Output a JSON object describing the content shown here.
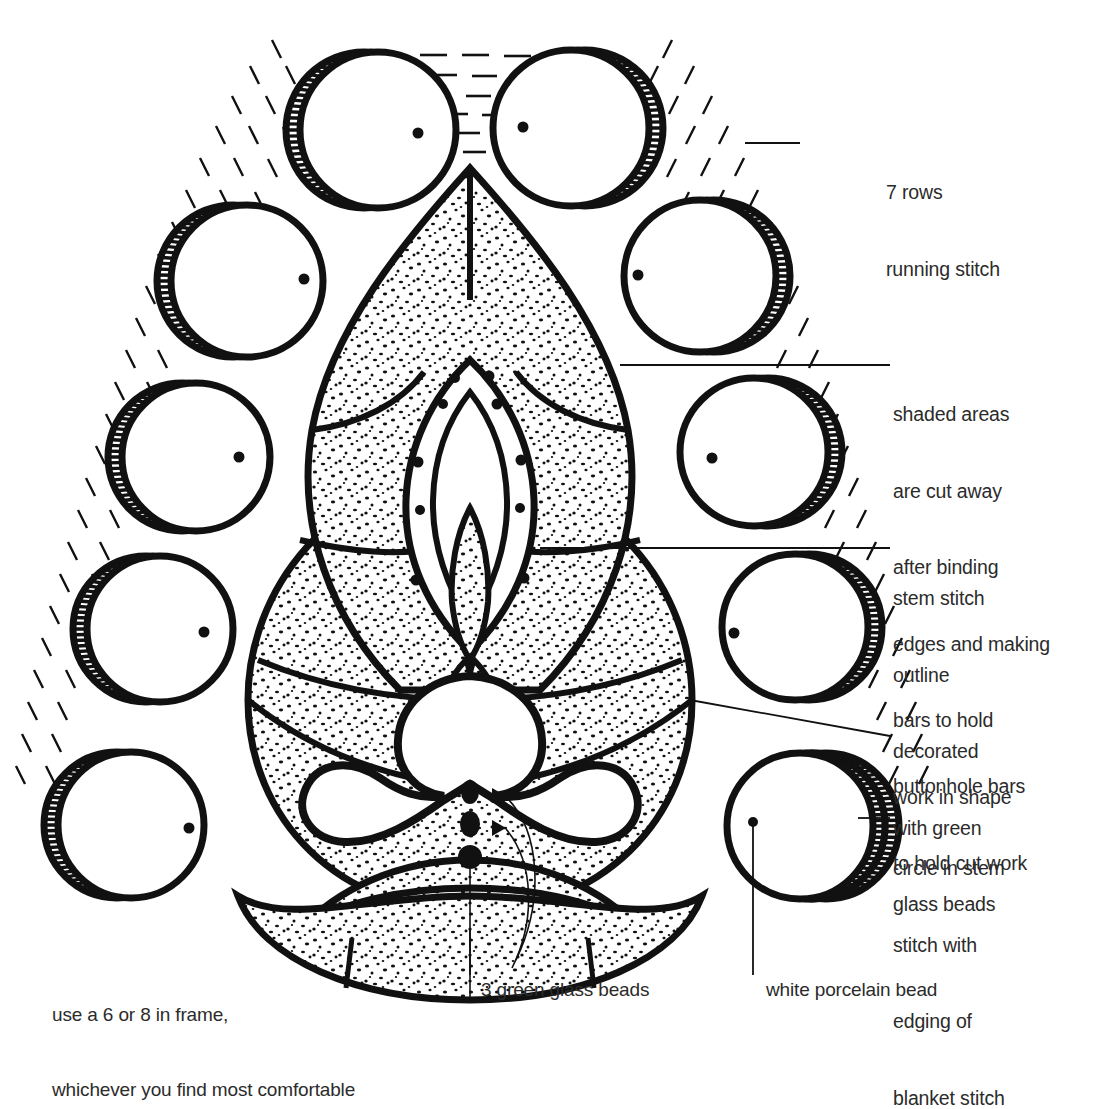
{
  "diagram": {
    "colors": {
      "ink": "#111111",
      "paper": "#ffffff",
      "text": "#2b2b2b"
    },
    "annotations": [
      {
        "id": "running-stitch",
        "line1": "7 rows",
        "line2": "running stitch",
        "line3": "",
        "line4": "",
        "line5": "",
        "line6": ""
      },
      {
        "id": "shaded-areas",
        "line1": "shaded areas",
        "line2": "are cut away",
        "line3": "after binding",
        "line4": "edges and making",
        "line5": "bars to hold",
        "line6": "work in shape"
      },
      {
        "id": "stem-stitch",
        "line1": "stem stitch",
        "line2": "outline",
        "line3": "decorated",
        "line4": "with green",
        "line5": "glass beads",
        "line6": ""
      },
      {
        "id": "buttonhole-bars",
        "line1": "buttonhole bars",
        "line2": "to hold cut work",
        "line3": "",
        "line4": "",
        "line5": "",
        "line6": ""
      },
      {
        "id": "circle-stem-stitch",
        "line1": "circle in stem",
        "line2": "stitch with",
        "line3": "edging of",
        "line4": "blanket stitch",
        "line5": "",
        "line6": ""
      }
    ],
    "notes": {
      "frame_line1": "use a 6 or 8 in frame,",
      "frame_line2": "whichever you find most comfortable",
      "green_beads": "3 green glass beads",
      "porcelain_bead": "white porcelain bead"
    },
    "bead_circles": [
      {
        "id": "bead-top-left",
        "cx": 378,
        "cy": 130,
        "r": 78,
        "hatch_side": "left",
        "dot_dx": 40,
        "dot_dy": 3
      },
      {
        "id": "bead-top-right",
        "cx": 571,
        "cy": 128,
        "r": 78,
        "hatch_side": "right",
        "dot_dx": -48,
        "dot_dy": -1
      },
      {
        "id": "bead-left-2",
        "cx": 247,
        "cy": 281,
        "r": 76,
        "hatch_side": "left",
        "dot_dx": 57,
        "dot_dy": -2
      },
      {
        "id": "bead-right-2",
        "cx": 700,
        "cy": 276,
        "r": 76,
        "hatch_side": "right",
        "dot_dx": -62,
        "dot_dy": -1
      },
      {
        "id": "bead-left-3",
        "cx": 196,
        "cy": 457,
        "r": 74,
        "hatch_side": "left",
        "dot_dx": 43,
        "dot_dy": 0
      },
      {
        "id": "bead-right-3",
        "cx": 754,
        "cy": 452,
        "r": 74,
        "hatch_side": "right",
        "dot_dx": -42,
        "dot_dy": 6
      },
      {
        "id": "bead-left-4",
        "cx": 160,
        "cy": 629,
        "r": 73,
        "hatch_side": "left",
        "dot_dx": 44,
        "dot_dy": 3
      },
      {
        "id": "bead-right-4",
        "cx": 795,
        "cy": 627,
        "r": 73,
        "hatch_side": "right",
        "dot_dx": -61,
        "dot_dy": 6
      },
      {
        "id": "bead-left-5",
        "cx": 131,
        "cy": 825,
        "r": 73,
        "hatch_side": "left",
        "dot_dx": 58,
        "dot_dy": 3
      },
      {
        "id": "bead-right-5",
        "cx": 812,
        "cy": 826,
        "r": 73,
        "hatch_side": "right",
        "dot_dx": -58,
        "dot_dy": -5
      }
    ],
    "green_bead_markers": [
      {
        "cx": 470,
        "cy": 792,
        "rx": 9,
        "ry": 12
      },
      {
        "cx": 470,
        "cy": 824,
        "rx": 10,
        "ry": 13
      },
      {
        "cx": 470,
        "cy": 857,
        "rx": 12,
        "ry": 12
      }
    ]
  }
}
